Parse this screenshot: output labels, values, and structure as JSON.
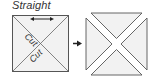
{
  "diagram": {
    "title_label": "Straight",
    "left_square": {
      "cut_labels": [
        "Cut",
        "Cut"
      ],
      "fill": "#f2f2f2",
      "stroke": "#555555"
    },
    "arrow": "right-arrow",
    "right_square": {
      "pieces": 4,
      "fill": "#f2f2f2",
      "stroke": "#555555"
    }
  }
}
